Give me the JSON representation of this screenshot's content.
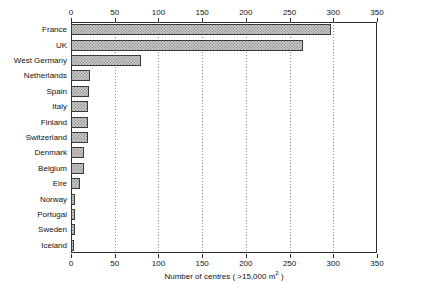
{
  "chart_data": {
    "type": "bar",
    "orientation": "horizontal",
    "title": "",
    "xlabel": "Number of centres ( >15,000 m² )",
    "ylabel": "",
    "xlim": [
      0,
      350
    ],
    "xticks": [
      0,
      50,
      100,
      150,
      200,
      250,
      300,
      350
    ],
    "grid": true,
    "grid_axis": "x",
    "legend": false,
    "axis_top": true,
    "axis_bottom": true,
    "categories": [
      "France",
      "UK",
      "West Germany",
      "Netherlands",
      "Spain",
      "Italy",
      "Finland",
      "Switzerland",
      "Denmark",
      "Belgium",
      "Eire",
      "Norway",
      "Portugal",
      "Sweden",
      "Iceland"
    ],
    "values": [
      297,
      265,
      80,
      22,
      21,
      20,
      19,
      19,
      15,
      15,
      10,
      5,
      5,
      5,
      4
    ],
    "bar_fill_color": "#cfcfcf",
    "bar_pattern_color": "#8d8d8d",
    "bar_edge_color": "#3a3a3a",
    "axis_color": "#2b2b2b",
    "grid_color": "#8a8a8a",
    "background_color": "#ffffff"
  },
  "axis_title": {
    "prefix": "Number of centres ( >15,000 m",
    "sup": "2",
    "suffix": " )"
  }
}
